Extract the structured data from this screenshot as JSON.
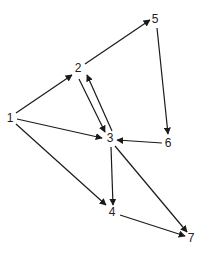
{
  "diagram": {
    "type": "directed-graph",
    "nodes": [
      {
        "id": "1",
        "label": "1",
        "x": 10,
        "y": 122
      },
      {
        "id": "2",
        "label": "2",
        "x": 78,
        "y": 72
      },
      {
        "id": "3",
        "label": "3",
        "x": 110,
        "y": 142
      },
      {
        "id": "4",
        "label": "4",
        "x": 112,
        "y": 216
      },
      {
        "id": "5",
        "label": "5",
        "x": 155,
        "y": 23
      },
      {
        "id": "6",
        "label": "6",
        "x": 168,
        "y": 147
      },
      {
        "id": "7",
        "label": "7",
        "x": 191,
        "y": 242
      }
    ],
    "edges": [
      {
        "from": "1",
        "to": "2",
        "x1": 16,
        "y1": 113,
        "x2": 72,
        "y2": 75
      },
      {
        "from": "1",
        "to": "3",
        "x1": 17,
        "y1": 119,
        "x2": 102,
        "y2": 138
      },
      {
        "from": "1",
        "to": "4",
        "x1": 16,
        "y1": 124,
        "x2": 106,
        "y2": 205
      },
      {
        "from": "2",
        "to": "5",
        "x1": 85,
        "y1": 64,
        "x2": 150,
        "y2": 20
      },
      {
        "from": "2",
        "to": "3",
        "x1": 79,
        "y1": 79,
        "x2": 105,
        "y2": 132
      },
      {
        "from": "3",
        "to": "2",
        "x1": 112,
        "y1": 131,
        "x2": 87,
        "y2": 75
      },
      {
        "from": "5",
        "to": "6",
        "x1": 157,
        "y1": 28,
        "x2": 168,
        "y2": 134
      },
      {
        "from": "6",
        "to": "3",
        "x1": 162,
        "y1": 143,
        "x2": 117,
        "y2": 140
      },
      {
        "from": "3",
        "to": "4",
        "x1": 111,
        "y1": 147,
        "x2": 113,
        "y2": 205
      },
      {
        "from": "3",
        "to": "7",
        "x1": 115,
        "y1": 146,
        "x2": 187,
        "y2": 232
      },
      {
        "from": "4",
        "to": "7",
        "x1": 120,
        "y1": 215,
        "x2": 185,
        "y2": 236
      }
    ]
  }
}
